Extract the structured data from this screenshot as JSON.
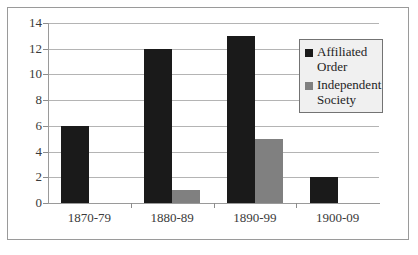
{
  "chart_data": {
    "type": "bar",
    "title": "",
    "xlabel": "",
    "ylabel": "",
    "grid": true,
    "legend_position": "inside-top-right",
    "ylim": [
      0,
      14
    ],
    "yticks": [
      0,
      2,
      4,
      6,
      8,
      10,
      12,
      14
    ],
    "ytick_labels": [
      "0",
      "2",
      "4",
      "6",
      "8",
      "10",
      "12",
      "14"
    ],
    "categories": [
      "1870-79",
      "1880-89",
      "1890-99",
      "1900-09"
    ],
    "series": [
      {
        "name": "Affiliated Order",
        "color": "#1a1a1a",
        "values": [
          6,
          12,
          13,
          2
        ]
      },
      {
        "name": "Independent Society",
        "color": "#808080",
        "values": [
          0,
          1,
          5,
          0
        ]
      }
    ]
  },
  "legend": {
    "entries": [
      {
        "label_line1": "Affiliated",
        "label_line2": "Order",
        "swatch": "affiliated-swatch-icon"
      },
      {
        "label_line1": "Independent",
        "label_line2": "Society",
        "swatch": "independent-swatch-icon"
      }
    ]
  },
  "colors": {
    "affiliated": "#1a1a1a",
    "independent": "#808080",
    "gridline": "#b4b4b4",
    "axis": "#9a9a9a",
    "frame_border": "#9a9a9a",
    "legend_background": "#f0f0f0",
    "legend_border": "#737373",
    "text": "#3a3a3a"
  }
}
